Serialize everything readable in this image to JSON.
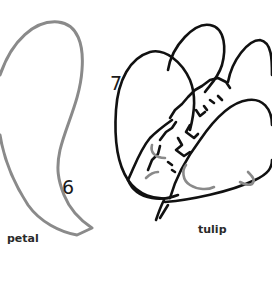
{
  "illustration": {
    "left_panel": {
      "step_number": "6",
      "caption": "petal",
      "stroke_color": "#8a8a8a"
    },
    "right_panel": {
      "step_number": "7",
      "caption": "tulip",
      "stroke_color": "#111111",
      "accent_stroke_color": "#8a8a8a"
    },
    "background_color": "#ffffff"
  }
}
